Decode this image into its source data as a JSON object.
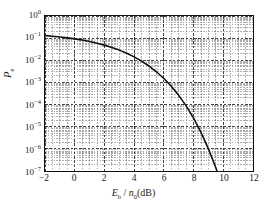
{
  "chart_data": {
    "type": "line",
    "title": "",
    "xlabel": "Eb / n0(dB)",
    "xlabel_parts": {
      "main_italic": "E",
      "main_sub": "b",
      "sep": " / ",
      "second_italic": "n",
      "second_sub": "0",
      "unit": "(dB)"
    },
    "ylabel": "Pe",
    "ylabel_parts": {
      "main_italic": "P",
      "main_sub": "e"
    },
    "xlim": [
      -2,
      12
    ],
    "ylim": [
      1e-07,
      1
    ],
    "yscale": "log",
    "xscale": "linear",
    "grid": "major and minor, dashed",
    "legend": "none",
    "xticks": [
      "-2",
      "0",
      "2",
      "4",
      "6",
      "8",
      "10",
      "12"
    ],
    "xtick_values": [
      -2,
      0,
      2,
      4,
      6,
      8,
      10,
      12
    ],
    "ytick_labels": [
      "10",
      "10",
      "10",
      "10",
      "10",
      "10",
      "10",
      "10"
    ],
    "ytick_exponents": [
      "0",
      "-1",
      "-2",
      "-3",
      "-4",
      "-5",
      "-6",
      "-7"
    ],
    "ytick_values": [
      1,
      0.1,
      0.01,
      0.001,
      0.0001,
      1e-05,
      1e-06,
      1e-07
    ],
    "series": [
      {
        "name": "Pe",
        "color": "#111111",
        "linewidth": 1.6,
        "x": [
          -2,
          -1.5,
          -1,
          -0.5,
          0,
          0.5,
          1,
          1.5,
          2,
          2.5,
          3,
          3.5,
          4,
          4.5,
          5,
          5.5,
          6,
          6.5,
          7,
          7.5,
          8,
          8.5,
          9,
          9.5,
          10,
          10.5,
          11,
          11.35
        ],
        "y": [
          0.13,
          0.122,
          0.113,
          0.103,
          0.0927,
          0.0818,
          0.0705,
          0.0593,
          0.0484,
          0.0381,
          0.0288,
          0.0208,
          0.0143,
          0.00921,
          0.00552,
          0.00303,
          0.00151,
          0.000671,
          0.000261,
          8.73e-05,
          2.44e-05,
          5.54e-06,
          1e-06,
          1.4e-07,
          1.45e-08,
          1.1e-09,
          5.8e-11,
          1.2e-11
        ]
      }
    ]
  }
}
